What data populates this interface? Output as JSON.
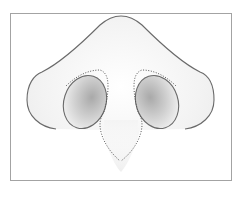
{
  "diagram": {
    "labels": [],
    "colors": {
      "frame": "#a3a3a3",
      "outline": "#6a6a6a",
      "dotted": "#555555",
      "skin_fill_light": "#f4f4f4",
      "nostril_shade": "#b5b5b5",
      "background": "#ffffff"
    },
    "parts": [
      {
        "id": "outer-contour",
        "description": "Outer nose outline (dorsum and alae)"
      },
      {
        "id": "left-nostril",
        "description": "Left nostril opening"
      },
      {
        "id": "right-nostril",
        "description": "Right nostril opening"
      },
      {
        "id": "columella-dotted-outline",
        "description": "Dotted outline of columella and medial crura"
      }
    ]
  }
}
